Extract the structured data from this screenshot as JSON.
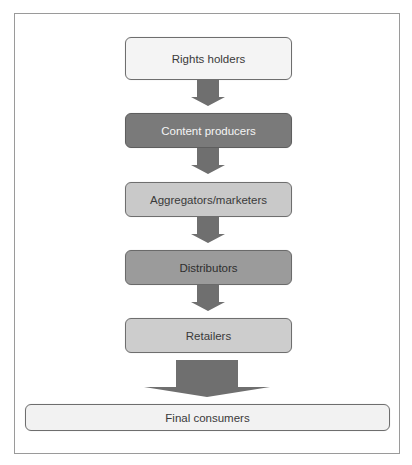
{
  "diagram": {
    "type": "vertical-flow",
    "frame": {
      "border_color": "#9a9a9a"
    },
    "arrow_color": "#6f6f6f",
    "nodes": [
      {
        "id": "rights-holders",
        "label": "Rights holders",
        "fill": "#f4f4f4",
        "text_color": "#3a3a3a"
      },
      {
        "id": "content-producers",
        "label": "Content producers",
        "fill": "#7a7a7a",
        "text_color": "#f5f5f5"
      },
      {
        "id": "aggregators-marketers",
        "label": "Aggregators/marketers",
        "fill": "#c9c9c9",
        "text_color": "#3a3a3a"
      },
      {
        "id": "distributors",
        "label": "Distributors",
        "fill": "#9b9b9b",
        "text_color": "#2e2e2e"
      },
      {
        "id": "retailers",
        "label": "Retailers",
        "fill": "#cdcdcd",
        "text_color": "#3a3a3a"
      },
      {
        "id": "final-consumers",
        "label": "Final consumers",
        "fill": "#f2f2f2",
        "text_color": "#3a3a3a"
      }
    ],
    "edges": [
      {
        "from": "rights-holders",
        "to": "content-producers"
      },
      {
        "from": "content-producers",
        "to": "aggregators-marketers"
      },
      {
        "from": "aggregators-marketers",
        "to": "distributors"
      },
      {
        "from": "distributors",
        "to": "retailers"
      },
      {
        "from": "retailers",
        "to": "final-consumers",
        "style": "wide"
      }
    ]
  }
}
